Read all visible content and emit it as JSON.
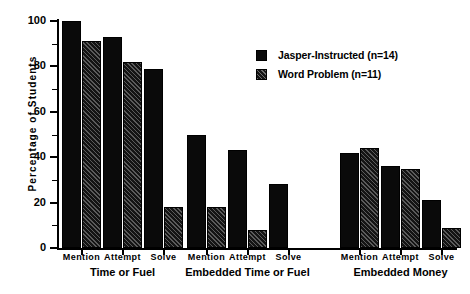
{
  "chart_data": {
    "type": "bar",
    "title": "",
    "xlabel": "",
    "ylabel": "Percentage  of  Students",
    "ylim": [
      0,
      100
    ],
    "yticks": [
      0,
      20,
      40,
      60,
      80,
      100
    ],
    "yticks_minor": [
      10,
      30,
      50,
      70,
      90
    ],
    "grid": false,
    "legend_position": "upper-right",
    "categories": [
      "Mention",
      "Attempt",
      "Solve",
      "Mention",
      "Attempt",
      "Solve",
      "Mention",
      "Attempt",
      "Solve"
    ],
    "groups": [
      {
        "label": "Time or Fuel",
        "categories": [
          "Mention",
          "Attempt",
          "Solve"
        ]
      },
      {
        "label": "Embedded Time or Fuel",
        "categories": [
          "Mention",
          "Attempt",
          "Solve"
        ]
      },
      {
        "label": "Embedded Money",
        "categories": [
          "Mention",
          "Attempt",
          "Solve"
        ]
      }
    ],
    "series": [
      {
        "name": "Jasper-Instructed (n=14)",
        "style": "solid-black",
        "color": "#0a0a0a",
        "values": [
          100,
          93,
          79,
          50,
          43,
          28,
          42,
          36,
          21
        ]
      },
      {
        "name": "Word Problem (n=11)",
        "style": "hatched-black",
        "color": "#141414",
        "values": [
          91,
          82,
          18,
          18,
          8,
          0,
          44,
          35,
          9
        ]
      }
    ]
  },
  "legend": {
    "items": [
      {
        "label": "Jasper-Instructed (n=14)"
      },
      {
        "label": "Word Problem (n=11)"
      }
    ]
  }
}
